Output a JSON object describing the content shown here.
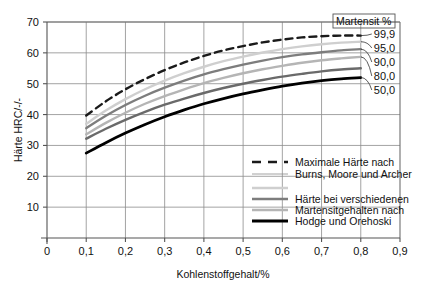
{
  "figure": {
    "background_color": "#ffffff",
    "width": 422,
    "height": 288
  },
  "chart_data": {
    "type": "line",
    "title": "",
    "xlabel": "Kohlenstoffgehalt/%",
    "ylabel": "Härte HRC/-/-",
    "xlim": [
      0,
      0.9
    ],
    "ylim": [
      0,
      70
    ],
    "grid": true,
    "xticks": [
      0,
      0.1,
      0.2,
      0.3,
      0.4,
      0.5,
      0.6,
      0.7,
      0.8,
      0.9
    ],
    "xtick_labels": [
      "0",
      "0,1",
      "0,2",
      "0,3",
      "0,4",
      "0,5",
      "0,6",
      "0,7",
      "0,8",
      "0,9"
    ],
    "yticks": [
      0,
      10,
      20,
      30,
      40,
      50,
      60,
      70
    ],
    "ytick_labels": [
      "",
      "10",
      "20",
      "30",
      "40",
      "50",
      "60",
      "70"
    ],
    "legend_position": "inside-lower-right",
    "annotations": [
      {
        "name": "martensite-header",
        "text": "Martensit %"
      }
    ],
    "series": [
      {
        "name": "99,9",
        "label": "99,9",
        "style": "dashed",
        "color": "#1a1a1a",
        "width": 2.4,
        "description": "Maximale Härte nach Burns, Moore und Archer",
        "x": [
          0.1,
          0.15,
          0.2,
          0.25,
          0.3,
          0.35,
          0.4,
          0.45,
          0.5,
          0.55,
          0.6,
          0.65,
          0.7,
          0.75,
          0.8
        ],
        "y": [
          39.7,
          44.3,
          48.2,
          51.5,
          54.4,
          56.9,
          59.0,
          60.8,
          62.2,
          63.4,
          64.3,
          65.0,
          65.4,
          65.6,
          65.6
        ]
      },
      {
        "name": "95,0",
        "label": "95,0",
        "style": "solid",
        "color": "#cfcfcf",
        "width": 2.4,
        "x": [
          0.1,
          0.15,
          0.2,
          0.25,
          0.3,
          0.35,
          0.4,
          0.45,
          0.5,
          0.55,
          0.6,
          0.65,
          0.7,
          0.75,
          0.8
        ],
        "y": [
          37.0,
          41.3,
          45.0,
          48.2,
          51.0,
          53.4,
          55.5,
          57.3,
          58.8,
          60.1,
          61.2,
          62.1,
          62.8,
          63.3,
          63.6
        ]
      },
      {
        "name": "90,0",
        "label": "90,0",
        "style": "solid",
        "color": "#7d7d7d",
        "width": 2.4,
        "x": [
          0.1,
          0.15,
          0.2,
          0.25,
          0.3,
          0.35,
          0.4,
          0.45,
          0.5,
          0.55,
          0.6,
          0.65,
          0.7,
          0.75,
          0.8
        ],
        "y": [
          35.6,
          39.6,
          43.1,
          46.1,
          48.7,
          51.0,
          53.0,
          54.7,
          56.2,
          57.5,
          58.6,
          59.5,
          60.2,
          60.8,
          61.2
        ]
      },
      {
        "name": "80,0",
        "label": "80,0",
        "style": "solid",
        "color": "#b5b5b5",
        "width": 2.4,
        "x": [
          0.1,
          0.15,
          0.2,
          0.25,
          0.3,
          0.35,
          0.4,
          0.45,
          0.5,
          0.55,
          0.6,
          0.65,
          0.7,
          0.75,
          0.8
        ],
        "y": [
          33.6,
          37.3,
          40.6,
          43.5,
          46.0,
          48.2,
          50.2,
          51.9,
          53.4,
          54.7,
          55.8,
          56.8,
          57.6,
          58.2,
          58.7
        ]
      },
      {
        "name": "50,0-upper",
        "label": "",
        "style": "solid",
        "color": "#6a6a6a",
        "width": 2.4,
        "x": [
          0.1,
          0.15,
          0.2,
          0.25,
          0.3,
          0.35,
          0.4,
          0.45,
          0.5,
          0.55,
          0.6,
          0.65,
          0.7,
          0.75,
          0.8
        ],
        "y": [
          32.2,
          35.4,
          38.3,
          40.9,
          43.2,
          45.2,
          47.0,
          48.6,
          50.0,
          51.2,
          52.3,
          53.2,
          54.0,
          54.6,
          55.0
        ]
      },
      {
        "name": "50,0",
        "label": "50,0",
        "style": "solid",
        "color": "#000000",
        "width": 2.8,
        "description": "Härte bei verschiedenen Martensitgehalten nach Hodge und Orehoski",
        "x": [
          0.1,
          0.15,
          0.2,
          0.25,
          0.3,
          0.35,
          0.4,
          0.45,
          0.5,
          0.55,
          0.6,
          0.65,
          0.7,
          0.75,
          0.8
        ],
        "y": [
          27.5,
          30.9,
          34.0,
          36.8,
          39.3,
          41.5,
          43.5,
          45.2,
          46.7,
          48.0,
          49.2,
          50.2,
          51.0,
          51.6,
          52.0
        ]
      }
    ],
    "legend": [
      {
        "swatch": "dashed",
        "color": "#1a1a1a",
        "width": 2.4,
        "line1": "Maximale Härte nach",
        "line2": "Burns, Moore und Archer"
      },
      {
        "swatch": "solid",
        "color": "#cfcfcf",
        "width": 2.4,
        "line1": "",
        "line2": ""
      },
      {
        "swatch": "solid",
        "color": "#7d7d7d",
        "width": 2.4,
        "line1": "Härte bei verschiedenen",
        "line2": ""
      },
      {
        "swatch": "solid",
        "color": "#b5b5b5",
        "width": 2.4,
        "line1": "Martensitgehalten nach",
        "line2": ""
      },
      {
        "swatch": "solid",
        "color": "#6a6a6a",
        "width": 2.4,
        "line1": "",
        "line2": ""
      },
      {
        "swatch": "solid",
        "color": "#000000",
        "width": 2.8,
        "line1": "Hodge und Orehoski",
        "line2": ""
      }
    ],
    "legend_lines": [
      "Maximale Härte nach",
      "Burns, Moore und Archer",
      "Härte bei verschiedenen",
      "Martensitgehalten nach",
      "Hodge und Orehoski"
    ]
  }
}
